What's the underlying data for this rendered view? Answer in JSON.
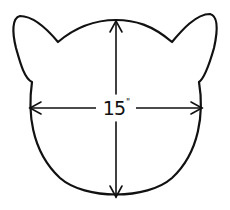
{
  "diagram": {
    "dimension_label": {
      "value": "15",
      "unit": "\""
    },
    "colors": {
      "stroke": "#111111",
      "background": "#ffffff"
    }
  }
}
